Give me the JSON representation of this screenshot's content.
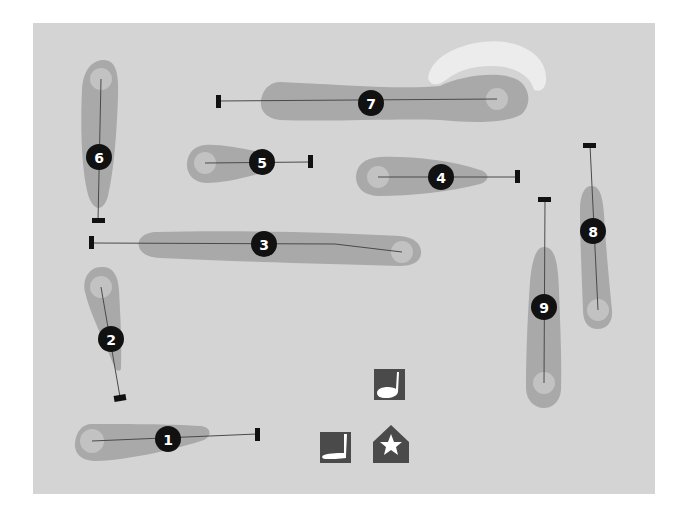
{
  "map": {
    "background": "#d4d4d4",
    "fairway_color": "#a9a9a9",
    "green_color": "#c2c2c2",
    "bunker_color": "#ececec",
    "line_color": "#4a4a4a",
    "marker_color": "#111111",
    "bounds": {
      "x": 33,
      "y": 23,
      "width": 622,
      "height": 471
    }
  },
  "holes": [
    {
      "number": "1",
      "label": "1",
      "tee": [
        257,
        434
      ],
      "green": [
        92,
        441
      ],
      "marker": [
        168,
        439
      ]
    },
    {
      "number": "2",
      "label": "2",
      "tee": [
        120,
        397
      ],
      "green": [
        101,
        287
      ],
      "marker": [
        111,
        339
      ]
    },
    {
      "number": "3",
      "label": "3",
      "tee": [
        92,
        243
      ],
      "green": [
        402,
        252
      ],
      "marker": [
        264,
        244
      ]
    },
    {
      "number": "4",
      "label": "4",
      "tee": [
        517,
        177
      ],
      "green": [
        378,
        177
      ],
      "marker": [
        441,
        177
      ]
    },
    {
      "number": "5",
      "label": "5",
      "tee": [
        310,
        162
      ],
      "green": [
        205,
        163
      ],
      "marker": [
        262,
        162
      ]
    },
    {
      "number": "6",
      "label": "6",
      "tee": [
        98,
        221
      ],
      "green": [
        101,
        79
      ],
      "marker": [
        99,
        157
      ]
    },
    {
      "number": "7",
      "label": "7",
      "tee": [
        218,
        101
      ],
      "green": [
        497,
        99
      ],
      "marker": [
        371,
        103
      ]
    },
    {
      "number": "8",
      "label": "8",
      "tee": [
        590,
        145
      ],
      "green": [
        598,
        310
      ],
      "marker": [
        593,
        231
      ]
    },
    {
      "number": "9",
      "label": "9",
      "tee": [
        545,
        199
      ],
      "green": [
        544,
        383
      ],
      "marker": [
        544,
        307
      ]
    }
  ],
  "legend_icons": [
    {
      "name": "driving-range-icon",
      "label": "Driving range"
    },
    {
      "name": "putting-green-icon",
      "label": "Putting green"
    },
    {
      "name": "clubhouse-icon",
      "label": "Clubhouse"
    }
  ]
}
